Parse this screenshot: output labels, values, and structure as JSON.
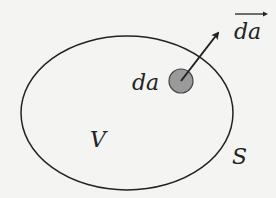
{
  "diagram": {
    "labels": {
      "area_element": "da",
      "volume": "V",
      "surface": "S",
      "area_vector": "da"
    },
    "colors": {
      "background": "#f4f4f2",
      "stroke": "#222222",
      "patch_fill": "#9a9a9a"
    }
  }
}
